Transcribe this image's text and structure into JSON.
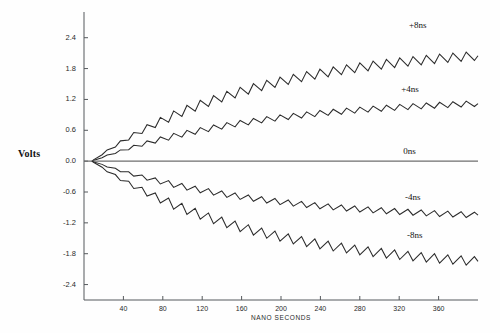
{
  "chart_data": {
    "type": "line",
    "title": "",
    "xlabel": "NANO SECONDS",
    "ylabel": "Volts",
    "xlim": [
      0,
      400
    ],
    "ylim": [
      -2.7,
      2.9
    ],
    "grid": false,
    "legend_position": "inline-right",
    "xticks": [
      40,
      80,
      120,
      160,
      200,
      240,
      280,
      320,
      360
    ],
    "xtick_labels": [
      "40",
      "80",
      "120",
      "160",
      "200",
      "240",
      "280",
      "320",
      "360"
    ],
    "yticks": [
      2.4,
      1.8,
      1.2,
      0.6,
      0.0,
      -0.6,
      -1.2,
      -1.8,
      -2.4
    ],
    "ytick_labels": [
      "2.4",
      "1.8",
      "1.2",
      "0.6",
      "0.0",
      "-0.6",
      "-1.2",
      "-1.8",
      "-2.4"
    ],
    "ripple_period_ns": 13.5,
    "series": [
      {
        "name": "+8ns",
        "label": "+8ns",
        "color": "#2b2b2b",
        "start": [
          8,
          0.0
        ],
        "end": [
          400,
          2.05
        ],
        "envelope_final": 2.05,
        "ripple_amplitude": 0.16,
        "label_x": 330,
        "label_y": 2.62
      },
      {
        "name": "+4ns",
        "label": "+4ns",
        "color": "#2b2b2b",
        "start": [
          8,
          0.0
        ],
        "end": [
          400,
          1.12
        ],
        "envelope_final": 1.12,
        "ripple_amplitude": 0.1,
        "label_x": 322,
        "label_y": 1.38
      },
      {
        "name": "0ns",
        "label": "0ns",
        "color": "#6e6e6e",
        "start": [
          0,
          0.0
        ],
        "end": [
          400,
          0.0
        ],
        "envelope_final": 0.0,
        "ripple_amplitude": 0.0,
        "label_x": 324,
        "label_y": 0.17
      },
      {
        "name": "-4ns",
        "label": "-4ns",
        "color": "#2b2b2b",
        "start": [
          8,
          0.0
        ],
        "end": [
          400,
          -1.05
        ],
        "envelope_final": -1.05,
        "ripple_amplitude": 0.1,
        "label_x": 326,
        "label_y": -0.72
      },
      {
        "name": "-8ns",
        "label": "-8ns",
        "color": "#2b2b2b",
        "start": [
          8,
          0.0
        ],
        "end": [
          400,
          -1.95
        ],
        "envelope_final": -1.95,
        "ripple_amplitude": 0.16,
        "label_x": 328,
        "label_y": -1.46
      }
    ]
  },
  "axes": {
    "y_axis_title": "Volts",
    "x_axis_title": "NANO SECONDS"
  }
}
